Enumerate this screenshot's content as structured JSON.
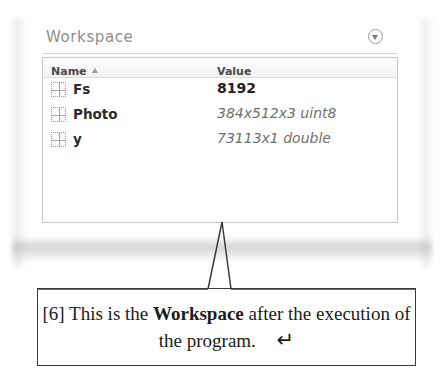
{
  "page": {
    "background_color": "#ffffff"
  },
  "workspace_panel": {
    "title": "Workspace",
    "collapse_button_icon": "chevron-down-circle-icon",
    "table": {
      "columns": [
        {
          "key": "name",
          "label": "Name",
          "sort_indicator": "ascending"
        },
        {
          "key": "value",
          "label": "Value"
        }
      ],
      "rows": [
        {
          "icon": "matrix-grid-icon",
          "name": "Fs",
          "value": "8192",
          "value_style": "numeric"
        },
        {
          "icon": "matrix-grid-icon",
          "name": "Photo",
          "value": "384x512x3 uint8",
          "value_style": "descriptor"
        },
        {
          "icon": "matrix-grid-icon",
          "name": "y",
          "value": "73113x1 double",
          "value_style": "descriptor"
        }
      ]
    }
  },
  "caption": {
    "marker": "[6]",
    "text_before": "This is the",
    "emphasis": "Workspace",
    "text_after": "after the execution of the program.",
    "return_symbol": "↵"
  },
  "colors": {
    "panel_title": "#8e8e8e",
    "table_border": "#c9c9c9",
    "value_descriptor": "#6f6f6f",
    "caption_border": "#3a3a3a"
  }
}
